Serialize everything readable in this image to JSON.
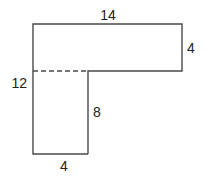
{
  "diagram": {
    "type": "L-shaped composite figure",
    "colors": {
      "stroke": "#4a4a4a",
      "text": "#222222",
      "background": "#ffffff"
    },
    "labels": {
      "top_width": "14",
      "right_height": "4",
      "left_height": "12",
      "inner_height": "8",
      "bottom_width": "4"
    },
    "shapes": [
      {
        "name": "top-rectangle",
        "width": 14,
        "height": 4
      },
      {
        "name": "bottom-rectangle",
        "width": 4,
        "height": 8
      }
    ],
    "divider": "dashed"
  }
}
